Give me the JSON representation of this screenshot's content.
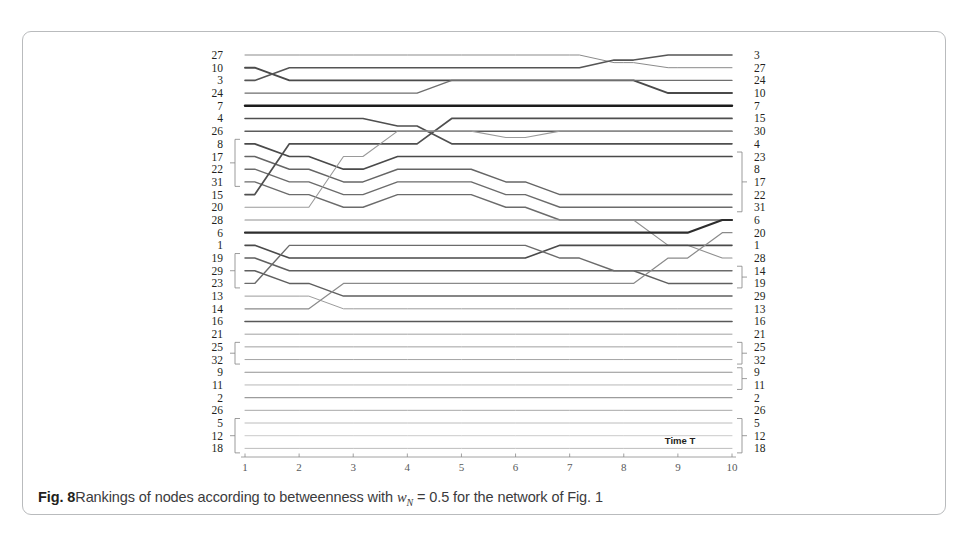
{
  "figure": {
    "caption_figno": "Fig. 8",
    "caption_text_a": "Rankings of nodes according to betweenness with ",
    "caption_var": "w",
    "caption_sub": "N",
    "caption_text_b": " = 0.5 for the network of Fig. 1",
    "axis_title": "Time T",
    "border_color": "#b9bbbd"
  },
  "chart_data": {
    "type": "line",
    "xlabel": "Time T",
    "ylabel": "",
    "xlim": [
      1,
      10
    ],
    "ylim": [
      1,
      32
    ],
    "grid": false,
    "legend": "none",
    "x": [
      1,
      2,
      3,
      4,
      5,
      6,
      7,
      8,
      9,
      10
    ],
    "x_ticks": [
      "1",
      "2",
      "3",
      "4",
      "5",
      "6",
      "7",
      "8",
      "9",
      "10"
    ],
    "rank_axis_note": "rank 1 = top row, rank 32 = bottom row; left tick labels are node IDs at T=1, right tick labels are node IDs at T=10",
    "left_labels": [
      "27",
      "10",
      "3",
      "24",
      "7",
      "4",
      "26",
      "8",
      "17",
      "22",
      "31",
      "15",
      "20",
      "28",
      "6",
      "1",
      "19",
      "29",
      "23",
      "13",
      "14",
      "16",
      "21",
      "25",
      "32",
      "9",
      "11",
      "2",
      "26",
      "5",
      "12",
      "18"
    ],
    "right_labels": [
      "3",
      "27",
      "24",
      "10",
      "7",
      "15",
      "30",
      "4",
      "23",
      "8",
      "17",
      "22",
      "31",
      "6",
      "20",
      "1",
      "28",
      "14",
      "19",
      "29",
      "13",
      "16",
      "21",
      "25",
      "32",
      "9",
      "11",
      "2",
      "26",
      "5",
      "12",
      "18"
    ],
    "left_brackets": [
      [
        7,
        10
      ],
      [
        16,
        18
      ],
      [
        23,
        24
      ],
      [
        29,
        31
      ]
    ],
    "right_brackets": [
      [
        8,
        12
      ],
      [
        17,
        18
      ],
      [
        23,
        24
      ],
      [
        25,
        26
      ],
      [
        29,
        31
      ]
    ],
    "series": [
      {
        "name": "27",
        "values": [
          1,
          1,
          1,
          1,
          1,
          1,
          1,
          1.6,
          2,
          2
        ],
        "weight": 1.0,
        "shade": "#8b8b8b"
      },
      {
        "name": "10",
        "values": [
          2,
          3,
          3,
          3,
          3,
          3,
          3,
          3,
          4,
          4
        ],
        "weight": 1.9,
        "shade": "#4a4a4a"
      },
      {
        "name": "3",
        "values": [
          3,
          2,
          2,
          2,
          2,
          2,
          2,
          1.4,
          1,
          1
        ],
        "weight": 1.6,
        "shade": "#555555"
      },
      {
        "name": "24",
        "values": [
          4,
          4,
          4,
          4,
          3,
          3,
          3,
          3,
          3,
          3
        ],
        "weight": 1.3,
        "shade": "#6e6e6e"
      },
      {
        "name": "7",
        "values": [
          5,
          5,
          5,
          5,
          5,
          5,
          5,
          5,
          5,
          5
        ],
        "weight": 2.4,
        "shade": "#1c1c1c"
      },
      {
        "name": "4",
        "values": [
          6,
          6,
          6,
          6.6,
          8,
          8,
          8,
          8,
          8,
          8
        ],
        "weight": 1.6,
        "shade": "#4f4f4f"
      },
      {
        "name": "26",
        "values": [
          7,
          7,
          7,
          7,
          7,
          7,
          7,
          7,
          7,
          7
        ],
        "weight": 1.5,
        "shade": "#5c5c5c"
      },
      {
        "name": "8",
        "values": [
          8,
          9,
          10,
          9,
          9,
          9,
          9,
          9,
          9,
          9
        ],
        "weight": 1.7,
        "shade": "#4a4a4a"
      },
      {
        "name": "17",
        "values": [
          9,
          10,
          11,
          10,
          10,
          11,
          12,
          12,
          12,
          12
        ],
        "weight": 1.5,
        "shade": "#656565"
      },
      {
        "name": "22",
        "values": [
          10,
          11,
          12,
          11,
          11,
          12,
          13,
          13,
          13,
          13
        ],
        "weight": 1.4,
        "shade": "#6b6b6b"
      },
      {
        "name": "31",
        "values": [
          11,
          12,
          13,
          12,
          12,
          13,
          14,
          14,
          14,
          14
        ],
        "weight": 1.4,
        "shade": "#6b6b6b"
      },
      {
        "name": "15",
        "values": [
          12,
          8,
          8,
          8,
          6,
          6,
          6,
          6,
          6,
          6
        ],
        "weight": 1.7,
        "shade": "#4f4f4f"
      },
      {
        "name": "20",
        "values": [
          13,
          13,
          9,
          7,
          7,
          7.5,
          7,
          7,
          7,
          7
        ],
        "weight": 1.1,
        "shade": "#9a9a9a"
      },
      {
        "name": "28",
        "values": [
          14,
          14,
          14,
          14,
          14,
          14,
          14,
          14,
          16,
          17
        ],
        "weight": 1.1,
        "shade": "#8f8f8f"
      },
      {
        "name": "6",
        "values": [
          15,
          15,
          15,
          15,
          15,
          15,
          15,
          15,
          15,
          14
        ],
        "weight": 2.1,
        "shade": "#2d2d2d"
      },
      {
        "name": "1",
        "values": [
          16,
          17,
          17,
          17,
          17,
          17,
          16,
          16,
          16,
          16
        ],
        "weight": 1.6,
        "shade": "#4a4a4a"
      },
      {
        "name": "19",
        "values": [
          17,
          18,
          18,
          18,
          18,
          18,
          18,
          18,
          19,
          19
        ],
        "weight": 1.5,
        "shade": "#5f5f5f"
      },
      {
        "name": "29",
        "values": [
          18,
          19,
          20,
          20,
          20,
          20,
          20,
          20,
          20,
          20
        ],
        "weight": 1.5,
        "shade": "#5f5f5f"
      },
      {
        "name": "23",
        "values": [
          19,
          16,
          16,
          16,
          16,
          16,
          17,
          18,
          18,
          18
        ],
        "weight": 1.4,
        "shade": "#6b6b6b"
      },
      {
        "name": "13",
        "values": [
          20,
          20,
          21,
          21,
          21,
          21,
          21,
          21,
          21,
          21
        ],
        "weight": 1.0,
        "shade": "#9c9c9c"
      },
      {
        "name": "14",
        "values": [
          21,
          21,
          19,
          19,
          19,
          19,
          19,
          19,
          17,
          15
        ],
        "weight": 1.2,
        "shade": "#8a8a8a"
      },
      {
        "name": "16",
        "values": [
          22,
          22,
          22,
          22,
          22,
          22,
          22,
          22,
          22,
          22
        ],
        "weight": 1.6,
        "shade": "#585858"
      },
      {
        "name": "21",
        "values": [
          23,
          23,
          23,
          23,
          23,
          23,
          23,
          23,
          23,
          23
        ],
        "weight": 1.0,
        "shade": "#a0a0a0"
      },
      {
        "name": "25",
        "values": [
          24,
          24,
          24,
          24,
          24,
          24,
          24,
          24,
          24,
          24
        ],
        "weight": 1.0,
        "shade": "#a0a0a0"
      },
      {
        "name": "32",
        "values": [
          25,
          25,
          25,
          25,
          25,
          25,
          25,
          25,
          25,
          25
        ],
        "weight": 1.0,
        "shade": "#a4a4a4"
      },
      {
        "name": "9",
        "values": [
          26,
          26,
          26,
          26,
          26,
          26,
          26,
          26,
          26,
          26
        ],
        "weight": 1.2,
        "shade": "#939393"
      },
      {
        "name": "11",
        "values": [
          27,
          27,
          27,
          27,
          27,
          27,
          27,
          27,
          27,
          27
        ],
        "weight": 0.9,
        "shade": "#b0b0b0"
      },
      {
        "name": "2",
        "values": [
          28,
          28,
          28,
          28,
          28,
          28,
          28,
          28,
          28,
          28
        ],
        "weight": 1.1,
        "shade": "#9c9c9c"
      },
      {
        "name": "26b",
        "values": [
          29,
          29,
          29,
          29,
          29,
          29,
          29,
          29,
          29,
          29
        ],
        "weight": 1.0,
        "shade": "#a8a8a8"
      },
      {
        "name": "5",
        "values": [
          30,
          30,
          30,
          30,
          30,
          30,
          30,
          30,
          30,
          30
        ],
        "weight": 0.9,
        "shade": "#b4b4b4"
      },
      {
        "name": "12",
        "values": [
          31,
          31,
          31,
          31,
          31,
          31,
          31,
          31,
          31,
          31
        ],
        "weight": 0.8,
        "shade": "#bcbcbc"
      },
      {
        "name": "18",
        "values": [
          32,
          32,
          32,
          32,
          32,
          32,
          32,
          32,
          32,
          32
        ],
        "weight": 0.9,
        "shade": "#b4b4b4"
      }
    ]
  }
}
